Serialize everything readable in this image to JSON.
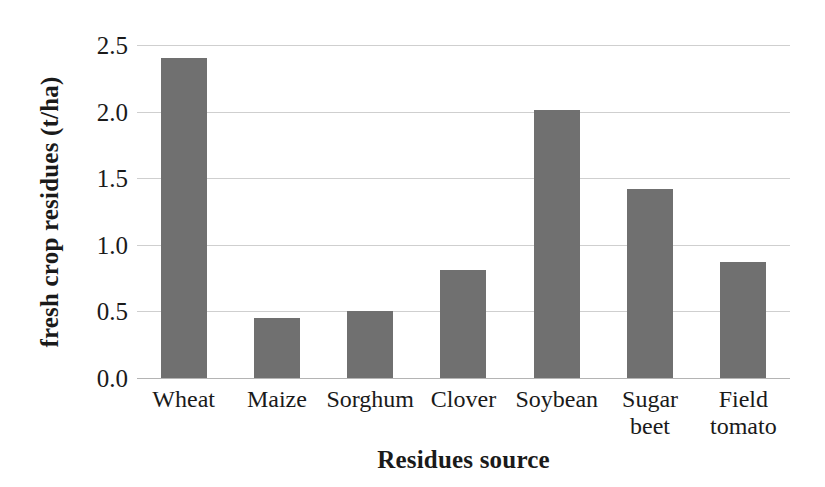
{
  "chart_data": {
    "type": "bar",
    "title": "",
    "xlabel": "Residues source",
    "ylabel": "fresh crop residues (t/ha)",
    "categories": [
      "Wheat",
      "Maize",
      "Sorghum",
      "Clover",
      "Soybean",
      "Sugar beet",
      "Field tomato"
    ],
    "category_labels_wrapped": [
      "Wheat",
      "Maize",
      "Sorghum",
      "Clover",
      "Soybean",
      "Sugar\nbeet",
      "Field\ntomato"
    ],
    "values": [
      2.4,
      0.45,
      0.5,
      0.81,
      2.01,
      1.42,
      0.87
    ],
    "ylim": [
      0.0,
      2.5
    ],
    "ytick_values": [
      0.0,
      0.5,
      1.0,
      1.5,
      2.0,
      2.5
    ],
    "ytick_labels": [
      "0.0",
      "0.5",
      "1.0",
      "1.5",
      "2.0",
      "2.5"
    ],
    "grid": true,
    "grid_axis": "y",
    "legend": false,
    "legend_position": "none",
    "bar_color": "#707070",
    "gridline_color": "#cfcfcf",
    "background_color": "#ffffff",
    "text_color": "#1a1a1a"
  }
}
